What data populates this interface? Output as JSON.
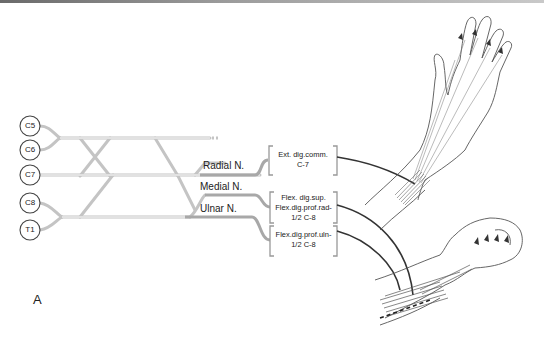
{
  "figure": {
    "panel_label": "A",
    "roots": [
      {
        "label": "C5"
      },
      {
        "label": "C6"
      },
      {
        "label": "C7"
      },
      {
        "label": "C8"
      },
      {
        "label": "T1"
      }
    ],
    "nerves": [
      {
        "label": "Radial N."
      },
      {
        "label": "Medial N."
      },
      {
        "label": "Ulnar N."
      }
    ],
    "muscle_boxes": [
      {
        "line1": "Ext. dig.comm.",
        "line2": "C-7"
      },
      {
        "line1": "Flex. dig.sup.",
        "line2": "Flex.dig.prof.rad-",
        "line3": "1/2 C-8"
      },
      {
        "line1": "Flex.dig.prof.uln-",
        "line2": "1/2 C-8"
      }
    ],
    "illustrations": [
      {
        "name": "extended-hand-forearm"
      },
      {
        "name": "clenched-fist-forearm"
      }
    ],
    "colors": {
      "plexus_line": "#c8c8c8",
      "nerve_trunk": "#a8a8a8",
      "connector": "#333333",
      "text": "#222222"
    }
  }
}
